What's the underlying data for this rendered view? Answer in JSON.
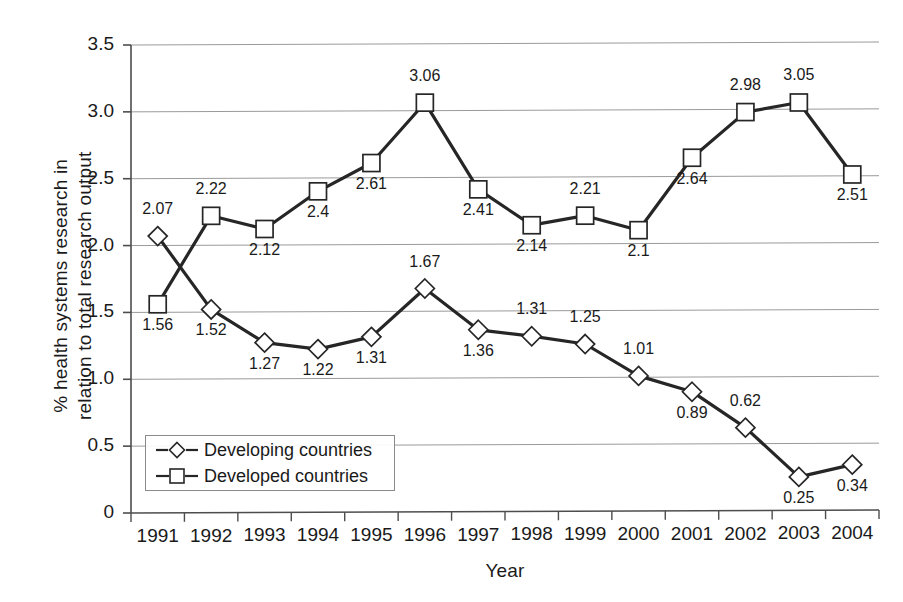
{
  "chart_data": {
    "type": "line",
    "title": "",
    "xlabel": "Year",
    "ylabel": "% health systems research in relation to total research output",
    "ylabel_line1": "% health systems research in",
    "ylabel_line2": "relation to total research output",
    "categories": [
      "1991",
      "1992",
      "1993",
      "1994",
      "1995",
      "1996",
      "1997",
      "1998",
      "1999",
      "2000",
      "2001",
      "2002",
      "2003",
      "2004"
    ],
    "ylim": [
      0,
      3.5
    ],
    "yticks": [
      "0",
      "0.5",
      "1.0",
      "1.5",
      "2.0",
      "2.5",
      "3.0",
      "3.5"
    ],
    "ytick_values": [
      0,
      0.5,
      1.0,
      1.5,
      2.0,
      2.5,
      3.0,
      3.5
    ],
    "grid": true,
    "legend_position": "lower-left-inside",
    "series": [
      {
        "name": "Developing countries",
        "marker": "diamond",
        "values": [
          2.07,
          1.52,
          1.27,
          1.22,
          1.31,
          1.67,
          1.36,
          1.31,
          1.25,
          1.01,
          0.89,
          0.62,
          0.25,
          0.34
        ],
        "labels": [
          "2.07",
          "1.52",
          "1.27",
          "1.22",
          "1.31",
          "1.67",
          "1.36",
          "1.31",
          "1.25",
          "1.01",
          "0.89",
          "0.62",
          "0.25",
          "0.34"
        ],
        "label_positions": [
          "above",
          "below",
          "below",
          "below",
          "below",
          "above",
          "below",
          "above",
          "above",
          "above",
          "below",
          "above",
          "below",
          "below"
        ]
      },
      {
        "name": "Developed countries",
        "marker": "square",
        "values": [
          1.56,
          2.22,
          2.12,
          2.4,
          2.61,
          3.06,
          2.41,
          2.14,
          2.21,
          2.1,
          2.64,
          2.98,
          3.05,
          2.51
        ],
        "labels": [
          "1.56",
          "2.22",
          "2.12",
          "2.4",
          "2.61",
          "3.06",
          "2.41",
          "2.14",
          "2.21",
          "2.1",
          "2.64",
          "2.98",
          "3.05",
          "2.51"
        ],
        "label_positions": [
          "below",
          "above",
          "below",
          "below",
          "below",
          "above",
          "below",
          "below",
          "above",
          "below",
          "below",
          "above",
          "above",
          "below"
        ]
      }
    ],
    "colors": {
      "line": "#262626",
      "marker_fill": "#ffffff",
      "marker_stroke": "#262626",
      "grid": "#9a9a9a",
      "axis": "#4d4d4d",
      "text": "#1a1a1a"
    }
  },
  "legend": {
    "items": [
      {
        "label": "Developing countries",
        "marker": "diamond"
      },
      {
        "label": "Developed countries",
        "marker": "square"
      }
    ]
  }
}
